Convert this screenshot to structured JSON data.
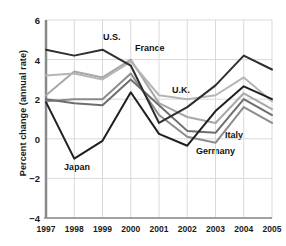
{
  "chart_data": {
    "type": "line",
    "title": "",
    "subtitle": "",
    "xlabel": "",
    "ylabel": "Percent change (annual rate)",
    "x": [
      "1997",
      "1998",
      "1999",
      "2000",
      "2001",
      "2002",
      "2003",
      "2004",
      "2005"
    ],
    "xticklabels": [
      "1997",
      "1998",
      "1999",
      "2000",
      "2001",
      "2002",
      "2003",
      "2004",
      "2005"
    ],
    "yticklabels": [
      "6",
      "4",
      "2",
      "0",
      "−2",
      "−4"
    ],
    "yticks": [
      6,
      4,
      2,
      0,
      -2,
      -4
    ],
    "ylim": [
      -4,
      6
    ],
    "grid": true,
    "grid_axis": "both",
    "legend": "inline-annotations",
    "legend_position": "on-plot",
    "series": [
      {
        "name": "U.S.",
        "color": "#2e2e2e",
        "values": [
          4.5,
          4.2,
          4.5,
          3.7,
          0.8,
          1.6,
          2.7,
          4.2,
          3.5
        ]
      },
      {
        "name": "France",
        "color": "#a8a8a8",
        "values": [
          2.2,
          3.4,
          3.1,
          4.0,
          1.8,
          1.1,
          0.8,
          2.3,
          1.5
        ]
      },
      {
        "name": "U.K.",
        "color": "#b5b5b5",
        "values": [
          3.2,
          3.3,
          3.0,
          3.9,
          2.2,
          2.0,
          2.2,
          3.1,
          1.9
        ]
      },
      {
        "name": "Germany",
        "color": "#8c8c8c",
        "values": [
          1.9,
          2.0,
          2.0,
          3.3,
          1.2,
          0.1,
          -0.2,
          1.6,
          0.8
        ]
      },
      {
        "name": "Italy",
        "color": "#6e6e6e",
        "values": [
          2.0,
          1.8,
          1.7,
          3.0,
          1.7,
          0.4,
          0.3,
          2.0,
          1.2
        ]
      },
      {
        "name": "Japan",
        "color": "#1f1f1f",
        "values": [
          1.85,
          -1.0,
          -0.1,
          2.35,
          0.25,
          -0.35,
          1.4,
          2.65,
          2.0
        ]
      }
    ],
    "annotations": [
      {
        "text": "U.S.",
        "x_px": 103,
        "y_px": 32
      },
      {
        "text": "France",
        "x_px": 135,
        "y_px": 43
      },
      {
        "text": "U.K.",
        "x_px": 172,
        "y_px": 85
      },
      {
        "text": "Italy",
        "x_px": 225,
        "y_px": 130
      },
      {
        "text": "Germany",
        "x_px": 196,
        "y_px": 146
      },
      {
        "text": "Japan",
        "x_px": 64,
        "y_px": 162
      }
    ],
    "style": {
      "grid_color": "#d9d9d9",
      "axis_color": "#555555",
      "background": "#ffffff",
      "line_width": 2
    }
  }
}
